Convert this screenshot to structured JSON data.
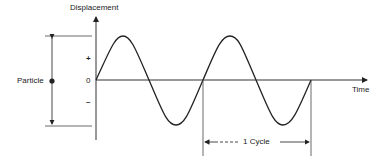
{
  "diagram": {
    "y_axis_label": "Displacement",
    "x_axis_label": "Time",
    "plus_label": "+",
    "zero_label": "0",
    "minus_label": "–",
    "particle_label": "Particle",
    "cycle_label": "1 Cycle"
  },
  "colors": {
    "ink": "#222222",
    "background": "#ffffff"
  }
}
